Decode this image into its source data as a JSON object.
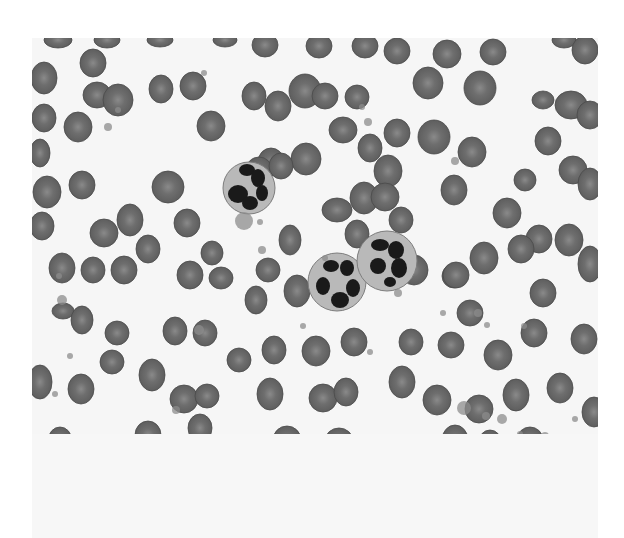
{
  "image": {
    "subject": "Peripheral blood smear micrograph",
    "palette": {
      "background": "#ffffff",
      "field": "#f6f6f6",
      "rbc": "#5e5e5e",
      "rbc_center": "#8a8a8a",
      "nucleus": "#1a1a1a",
      "cytoplasm": "#b9b9b9",
      "platelet": "#8c8c8c"
    },
    "cells": {
      "neutrophils": [
        {
          "label": "neutrophil",
          "lobes": 4
        },
        {
          "label": "neutrophil",
          "lobes": 5
        },
        {
          "label": "neutrophil",
          "lobes": 4
        }
      ],
      "red_blood_cells": "numerous",
      "platelets": "scattered"
    }
  }
}
